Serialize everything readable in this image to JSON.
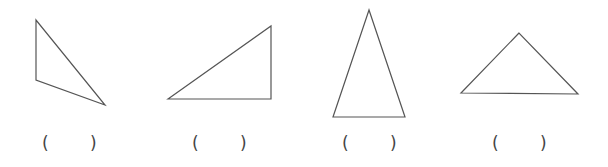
{
  "worksheet": {
    "stroke_color": "#555555",
    "items": [
      {
        "label": "triangle-1",
        "points": "36,20 36,80 105,105",
        "answer_open": "(",
        "answer_close": ")",
        "answer_value": "",
        "paren_left_x": 42,
        "paren_right_x": 90
      },
      {
        "label": "triangle-2",
        "points": "168,99 271,26 271,99",
        "answer_open": "(",
        "answer_close": ")",
        "answer_value": "",
        "paren_left_x": 192,
        "paren_right_x": 240
      },
      {
        "label": "triangle-3",
        "points": "369,10 333,117 405,117",
        "answer_open": "(",
        "answer_close": ")",
        "answer_value": "",
        "paren_left_x": 342,
        "paren_right_x": 390
      },
      {
        "label": "triangle-4",
        "points": "519,33 461,93 578,94",
        "answer_open": "(",
        "answer_close": ")",
        "answer_value": "",
        "paren_left_x": 492,
        "paren_right_x": 540
      }
    ]
  }
}
